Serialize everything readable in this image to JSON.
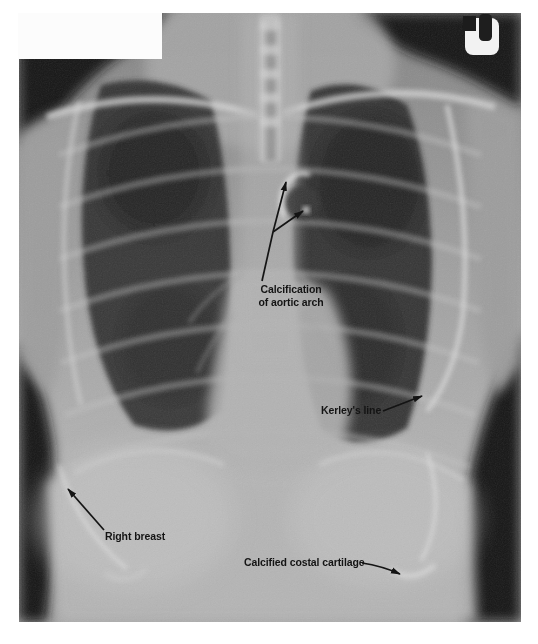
{
  "figure": {
    "annotations": {
      "aortic_arch": {
        "line1": "Calcification",
        "line2": "of aortic arch"
      },
      "kerleys_line": {
        "label": "Kerley's line"
      },
      "right_breast": {
        "label": "Right breast"
      },
      "costal_cartilage": {
        "label": "Calcified costal cartilage"
      }
    },
    "icons": {
      "film_marker": "radiograph-side-marker"
    },
    "colors": {
      "annotation_ink": "#141414",
      "page_background": "#ffffff",
      "film_shadow": "#181818",
      "film_marker_face": "#f2f2f2",
      "lung_field": "#2d2d2d",
      "soft_tissue": "#b5b5b5"
    }
  }
}
